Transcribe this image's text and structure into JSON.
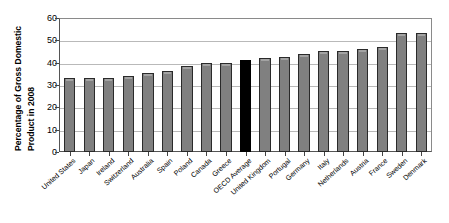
{
  "chart_data": {
    "type": "bar",
    "title": "",
    "subtitle": "",
    "xlabel": "",
    "ylabel": "Percentage of Gross Domestic Product in 2008",
    "ylabel_line1": "Percentage of Gross Domestic",
    "ylabel_line2": "Product in 2008",
    "ylim": [
      0,
      60
    ],
    "yticks": [
      0,
      10,
      20,
      30,
      40,
      50,
      60
    ],
    "grid": true,
    "legend": "none",
    "bar_color": "#808080",
    "highlight_color": "#000000",
    "highlight_category": "OECD Average",
    "categories": [
      "United States",
      "Japan",
      "Ireland",
      "Switzerland",
      "Australia",
      "Spain",
      "Poland",
      "Canada",
      "Greece",
      "OECD Average",
      "United Kingdom",
      "Portugal",
      "Germany",
      "Italy",
      "Netherlands",
      "Austria",
      "France",
      "Sweden",
      "Denmark"
    ],
    "values": [
      33.5,
      33.5,
      33.5,
      34.5,
      35.5,
      36.5,
      39.0,
      40.0,
      40.0,
      41.5,
      42.5,
      43.0,
      44.0,
      45.5,
      45.5,
      46.5,
      47.5,
      53.5,
      53.5
    ]
  }
}
